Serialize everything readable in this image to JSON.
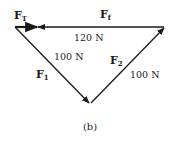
{
  "figure": {
    "caption": "(b)",
    "vectors": {
      "FT": {
        "symbol": "F",
        "subscript": "T"
      },
      "Ff": {
        "symbol": "F",
        "subscript": "f",
        "magnitude": "120 N"
      },
      "F1": {
        "symbol": "F",
        "subscript": "1",
        "magnitude": "100 N"
      },
      "F2": {
        "symbol": "F",
        "subscript": "2",
        "magnitude": "100 N"
      }
    },
    "colors": {
      "stroke": "#1a1a1a",
      "background": "#ffffff"
    }
  }
}
